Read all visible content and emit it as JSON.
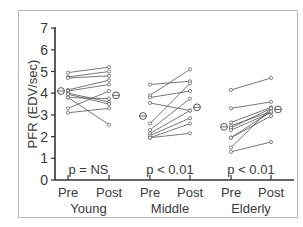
{
  "chart_data": {
    "type": "line",
    "title": "",
    "xlabel": "",
    "ylabel": "PFR (EDV/sec)",
    "ylim": [
      0,
      7
    ],
    "yticks": [
      0,
      1,
      2,
      3,
      4,
      5,
      6,
      7
    ],
    "grid": false,
    "legend": null,
    "groups": [
      {
        "name": "Young",
        "categories": [
          "Pre",
          "Post"
        ],
        "p_value": "p = NS",
        "mean_pre": 4.1,
        "mean_post": 3.9,
        "subjects": [
          [
            4.95,
            5.2
          ],
          [
            4.75,
            5.0
          ],
          [
            4.7,
            4.8
          ],
          [
            4.15,
            4.6
          ],
          [
            4.1,
            4.4
          ],
          [
            4.0,
            3.6
          ],
          [
            3.95,
            3.5
          ],
          [
            3.8,
            3.75
          ],
          [
            3.8,
            2.55
          ],
          [
            3.3,
            4.1
          ],
          [
            3.1,
            3.3
          ]
        ]
      },
      {
        "name": "Middle",
        "categories": [
          "Pre",
          "Post"
        ],
        "p_value": "p < 0.01",
        "mean_pre": 2.95,
        "mean_post": 3.35,
        "subjects": [
          [
            4.4,
            4.55
          ],
          [
            3.9,
            5.1
          ],
          [
            3.8,
            4.1
          ],
          [
            3.55,
            3.2
          ],
          [
            2.6,
            4.45
          ],
          [
            2.3,
            3.75
          ],
          [
            2.15,
            3.2
          ],
          [
            2.05,
            2.85
          ],
          [
            1.95,
            2.6
          ],
          [
            1.95,
            2.15
          ]
        ]
      },
      {
        "name": "Elderly",
        "categories": [
          "Pre",
          "Post"
        ],
        "p_value": "p < 0.01",
        "mean_pre": 2.45,
        "mean_post": 3.25,
        "subjects": [
          [
            4.15,
            4.7
          ],
          [
            3.3,
            3.6
          ],
          [
            2.65,
            3.35
          ],
          [
            2.5,
            3.15
          ],
          [
            2.4,
            3.3
          ],
          [
            2.3,
            3.1
          ],
          [
            1.95,
            2.95
          ],
          [
            1.5,
            3.3
          ],
          [
            1.3,
            1.75
          ],
          [
            1.95,
            3.15
          ]
        ]
      }
    ]
  },
  "labels": {
    "ylabel": "PFR (EDV/sec)",
    "groups": [
      "Young",
      "Middle",
      "Elderly"
    ],
    "pre": "Pre",
    "post": "Post",
    "pvalues": [
      "p = NS",
      "p < 0.01",
      "p < 0.01"
    ]
  }
}
